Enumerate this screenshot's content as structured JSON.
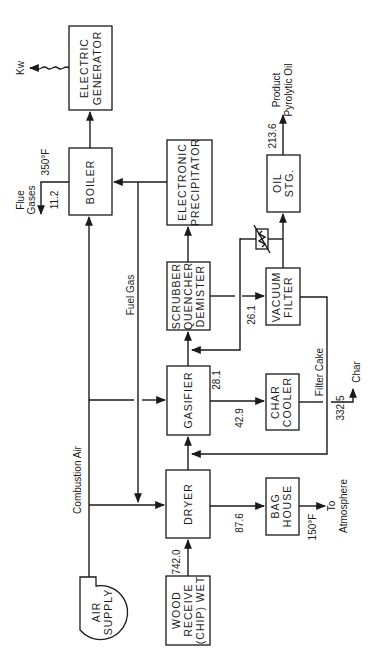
{
  "diagram": {
    "orientation": "rotated-90-ccw",
    "units": {
      "Kw": "Kw",
      "flue_temp": "350°F",
      "bag_temp": "150°F"
    },
    "nodes": {
      "electric_generator": [
        "ELECTRIC",
        "GENERATOR"
      ],
      "boiler": [
        "BOILER"
      ],
      "electronic_precipitator": [
        "ELECTRONIC",
        "PRECIPITATOR"
      ],
      "scrubber": [
        "SCRUBBER",
        "QUENCHER",
        "DEMISTER"
      ],
      "oil_storage": [
        "OIL",
        "STG."
      ],
      "vacuum_filter": [
        "VACUUM",
        "FILTER"
      ],
      "gasifier": [
        "GASIFIER"
      ],
      "char_cooler": [
        "CHAR",
        "COOLER"
      ],
      "dryer": [
        "DRYER"
      ],
      "bag_house": [
        "BAG",
        "HOUSE"
      ],
      "wood_receive": [
        "WOOD",
        "RECEIVE",
        "(CHIP) WET"
      ],
      "air_supply": [
        "AIR",
        "SUPPLY"
      ]
    },
    "streams": {
      "kw": "Kw",
      "flue_gases": [
        "Flue",
        "Gases"
      ],
      "flue_value": "11.2",
      "flue_temp": "350°F",
      "fuel_gas": "Fuel Gas",
      "combustion_air": "Combustion Air",
      "product": [
        "Product",
        "Pyrolytic Oil"
      ],
      "oil_value": "213.6",
      "vacuum_in": "26.1",
      "filter_cake": "Filter Cake",
      "char_value": "332.5",
      "char": "Char",
      "gasifier_to_scrubber": "28.1",
      "gasifier_to_cooler": "42.9",
      "dryer_to_baghouse": "87.6",
      "bag_temp": "150°F",
      "to_atmosphere": [
        "To",
        "Atmosphere"
      ],
      "wood_feed": "742.0"
    }
  }
}
